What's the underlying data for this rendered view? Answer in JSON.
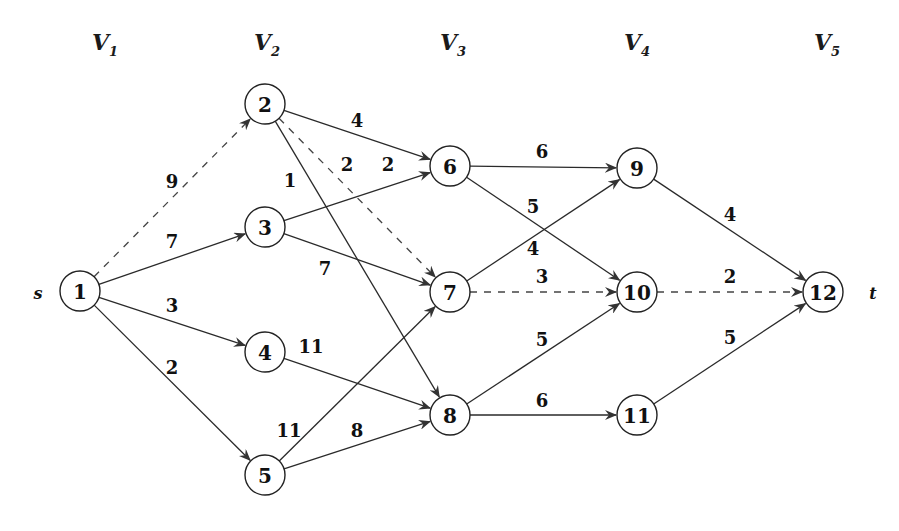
{
  "diagram": {
    "type": "multistage-graph",
    "stages": [
      {
        "label": "V",
        "sub": "1",
        "x": 100
      },
      {
        "label": "V",
        "sub": "2",
        "x": 262
      },
      {
        "label": "V",
        "sub": "3",
        "x": 448
      },
      {
        "label": "V",
        "sub": "4",
        "x": 632
      },
      {
        "label": "V",
        "sub": "5",
        "x": 822
      }
    ],
    "source_label": "s",
    "sink_label": "t",
    "nodes": [
      {
        "id": "1",
        "x": 80,
        "y": 291
      },
      {
        "id": "2",
        "x": 265,
        "y": 104
      },
      {
        "id": "3",
        "x": 265,
        "y": 227
      },
      {
        "id": "4",
        "x": 265,
        "y": 352
      },
      {
        "id": "5",
        "x": 265,
        "y": 475
      },
      {
        "id": "6",
        "x": 450,
        "y": 166
      },
      {
        "id": "7",
        "x": 450,
        "y": 292
      },
      {
        "id": "8",
        "x": 450,
        "y": 415
      },
      {
        "id": "9",
        "x": 637,
        "y": 168
      },
      {
        "id": "10",
        "x": 637,
        "y": 292
      },
      {
        "id": "11",
        "x": 637,
        "y": 415
      },
      {
        "id": "12",
        "x": 823,
        "y": 292
      }
    ],
    "edges": [
      {
        "from": "1",
        "to": "2",
        "weight": "9",
        "dashed": true,
        "lx": 172,
        "ly": 181
      },
      {
        "from": "1",
        "to": "3",
        "weight": "7",
        "dashed": false,
        "lx": 172,
        "ly": 241
      },
      {
        "from": "1",
        "to": "4",
        "weight": "3",
        "dashed": false,
        "lx": 172,
        "ly": 305
      },
      {
        "from": "1",
        "to": "5",
        "weight": "2",
        "dashed": false,
        "lx": 172,
        "ly": 367
      },
      {
        "from": "2",
        "to": "6",
        "weight": "4",
        "dashed": false,
        "lx": 357,
        "ly": 120
      },
      {
        "from": "2",
        "to": "7",
        "weight": "2",
        "dashed": true,
        "lx": 347,
        "ly": 164
      },
      {
        "from": "2",
        "to": "8",
        "weight": "1",
        "dashed": false,
        "lx": 290,
        "ly": 180
      },
      {
        "from": "3",
        "to": "6",
        "weight": "2",
        "dashed": false,
        "lx": 388,
        "ly": 164
      },
      {
        "from": "3",
        "to": "7",
        "weight": "7",
        "dashed": false,
        "lx": 325,
        "ly": 268
      },
      {
        "from": "4",
        "to": "8",
        "weight": "11",
        "dashed": false,
        "lx": 311,
        "ly": 346
      },
      {
        "from": "5",
        "to": "7",
        "weight": "11",
        "dashed": false,
        "lx": 289,
        "ly": 430
      },
      {
        "from": "5",
        "to": "8",
        "weight": "8",
        "dashed": false,
        "lx": 357,
        "ly": 430
      },
      {
        "from": "6",
        "to": "9",
        "weight": "6",
        "dashed": false,
        "lx": 542,
        "ly": 151
      },
      {
        "from": "6",
        "to": "10",
        "weight": "5",
        "dashed": false,
        "lx": 533,
        "ly": 206
      },
      {
        "from": "7",
        "to": "9",
        "weight": "4",
        "dashed": false,
        "lx": 533,
        "ly": 248
      },
      {
        "from": "7",
        "to": "10",
        "weight": "3",
        "dashed": true,
        "lx": 542,
        "ly": 276
      },
      {
        "from": "8",
        "to": "10",
        "weight": "5",
        "dashed": false,
        "lx": 542,
        "ly": 339
      },
      {
        "from": "8",
        "to": "11",
        "weight": "6",
        "dashed": false,
        "lx": 542,
        "ly": 400
      },
      {
        "from": "9",
        "to": "12",
        "weight": "4",
        "dashed": false,
        "lx": 730,
        "ly": 214
      },
      {
        "from": "10",
        "to": "12",
        "weight": "2",
        "dashed": true,
        "lx": 730,
        "ly": 276
      },
      {
        "from": "11",
        "to": "12",
        "weight": "5",
        "dashed": false,
        "lx": 730,
        "ly": 337
      }
    ]
  }
}
